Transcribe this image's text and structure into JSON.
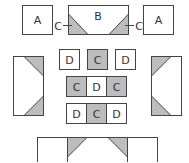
{
  "colors": {
    "stroke": "#444444",
    "shade": "#bdbdbd",
    "light": "#ffffff"
  },
  "top_row": {
    "left_a": "A",
    "center_b": "B",
    "left_c": "C",
    "right_c": "C",
    "right_a": "A"
  },
  "grid": {
    "row1": [
      "D",
      "C",
      "D"
    ],
    "row2": [
      "C",
      "D",
      "C"
    ],
    "row3": [
      "D",
      "C",
      "D"
    ]
  }
}
